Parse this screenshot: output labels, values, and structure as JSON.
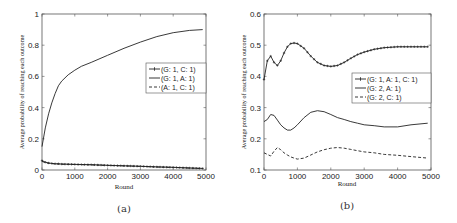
{
  "chart_data": [
    {
      "type": "line",
      "panel": "(a)",
      "title": "",
      "xlabel": "Round",
      "ylabel": "Average probability of reaching each outcome",
      "xlim": [
        0,
        5000
      ],
      "ylim": [
        0,
        1
      ],
      "xticks": [
        "0",
        "1000",
        "2000",
        "3000",
        "4000",
        "5000"
      ],
      "yticks": [
        "0",
        "0.2",
        "0.4",
        "0.6",
        "0.8",
        "1"
      ],
      "grid": false,
      "legend_position": "center-right",
      "x": [
        0,
        100,
        200,
        300,
        400,
        500,
        600,
        800,
        1000,
        1200,
        1500,
        2000,
        2500,
        3000,
        3500,
        4000,
        4500,
        4900
      ],
      "series": [
        {
          "name": "(G: 1, C: 1)",
          "style": "solid-plus-markers",
          "values": [
            0.06,
            0.05,
            0.045,
            0.042,
            0.04,
            0.04,
            0.038,
            0.037,
            0.036,
            0.035,
            0.034,
            0.03,
            0.027,
            0.024,
            0.02,
            0.017,
            0.013,
            0.01
          ]
        },
        {
          "name": "(G: 1, A: 1)",
          "style": "solid",
          "values": [
            0.15,
            0.27,
            0.36,
            0.43,
            0.49,
            0.54,
            0.57,
            0.61,
            0.64,
            0.665,
            0.69,
            0.735,
            0.78,
            0.82,
            0.855,
            0.88,
            0.895,
            0.9
          ]
        },
        {
          "name": "(A: 1, C: 1)",
          "style": "dashed",
          "values": [
            0.055,
            0.047,
            0.043,
            0.041,
            0.039,
            0.038,
            0.037,
            0.036,
            0.035,
            0.034,
            0.033,
            0.029,
            0.026,
            0.023,
            0.019,
            0.016,
            0.012,
            0.009
          ]
        }
      ]
    },
    {
      "type": "line",
      "panel": "(b)",
      "title": "",
      "xlabel": "Round",
      "ylabel": "Average probability of reaching each outcome",
      "xlim": [
        0,
        5000
      ],
      "ylim": [
        0.1,
        0.6
      ],
      "xticks": [
        "0",
        "1000",
        "2000",
        "3000",
        "4000",
        "5000"
      ],
      "yticks": [
        "0.1",
        "0.2",
        "0.3",
        "0.4",
        "0.5",
        "0.6"
      ],
      "grid": false,
      "legend_position": "center-right",
      "x": [
        0,
        100,
        200,
        300,
        400,
        500,
        600,
        700,
        800,
        900,
        1000,
        1200,
        1400,
        1600,
        1800,
        2000,
        2200,
        2400,
        2600,
        2800,
        3000,
        3300,
        3600,
        4000,
        4400,
        4900
      ],
      "series": [
        {
          "name": "(G: 1, A: 1, C: 1)",
          "style": "solid-plus-markers",
          "values": [
            0.39,
            0.45,
            0.465,
            0.445,
            0.435,
            0.45,
            0.475,
            0.495,
            0.505,
            0.507,
            0.505,
            0.49,
            0.465,
            0.445,
            0.435,
            0.432,
            0.435,
            0.445,
            0.458,
            0.47,
            0.478,
            0.487,
            0.492,
            0.495,
            0.495,
            0.495
          ]
        },
        {
          "name": "(G: 2, A: 1)",
          "style": "solid",
          "values": [
            0.255,
            0.262,
            0.278,
            0.275,
            0.26,
            0.245,
            0.235,
            0.228,
            0.228,
            0.235,
            0.245,
            0.268,
            0.285,
            0.29,
            0.287,
            0.278,
            0.268,
            0.262,
            0.255,
            0.25,
            0.245,
            0.242,
            0.238,
            0.238,
            0.245,
            0.25
          ]
        },
        {
          "name": "(G: 2, C: 1)",
          "style": "dashed",
          "values": [
            0.155,
            0.15,
            0.145,
            0.16,
            0.172,
            0.165,
            0.155,
            0.148,
            0.142,
            0.138,
            0.135,
            0.138,
            0.148,
            0.158,
            0.165,
            0.17,
            0.172,
            0.17,
            0.166,
            0.162,
            0.158,
            0.155,
            0.15,
            0.147,
            0.143,
            0.138
          ]
        }
      ]
    }
  ]
}
